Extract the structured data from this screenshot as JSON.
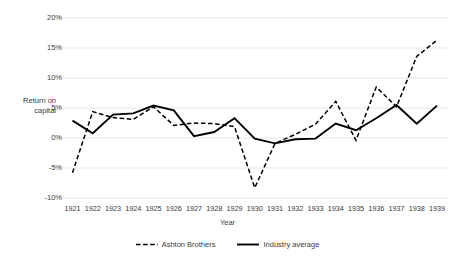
{
  "chart_data": {
    "type": "line",
    "title": "",
    "xlabel": "Year",
    "ylabel": "Return on\ncapital",
    "ylim": [
      -10,
      20
    ],
    "ytick_labels": [
      "20%",
      "15%",
      "10%",
      "5%",
      "0%",
      "-5%",
      "-10%"
    ],
    "ytick_values": [
      20,
      15,
      10,
      5,
      0,
      -5,
      -10
    ],
    "grid": true,
    "grid_axis": "y",
    "legend_position": "bottom",
    "categories": [
      "1921",
      "1922",
      "1923",
      "1924",
      "1925",
      "1926",
      "1927",
      "1928",
      "1929",
      "1930",
      "1931",
      "1932",
      "1933",
      "1934",
      "1935",
      "1936",
      "1937",
      "1938",
      "1939"
    ],
    "series": [
      {
        "name": "Ashton Brothers",
        "style": "dashed",
        "color": "#000000",
        "values": [
          -5.8,
          4.4,
          3.4,
          3.1,
          5.2,
          2.1,
          2.5,
          2.4,
          1.9,
          -8.3,
          -0.9,
          0.6,
          2.3,
          6.1,
          -0.4,
          8.5,
          5.2,
          13.6,
          16.3
        ]
      },
      {
        "name": "Industry average",
        "style": "solid",
        "color": "#000000",
        "values": [
          2.9,
          0.8,
          3.9,
          4.1,
          5.4,
          4.6,
          0.3,
          1.0,
          3.3,
          -0.1,
          -0.9,
          -0.2,
          -0.1,
          2.4,
          1.3,
          3.3,
          5.5,
          2.4,
          5.4
        ]
      }
    ]
  },
  "legend": {
    "items": [
      {
        "label": "Ashton Brothers",
        "style": "dashed"
      },
      {
        "label": "Industry average",
        "style": "solid"
      }
    ]
  }
}
